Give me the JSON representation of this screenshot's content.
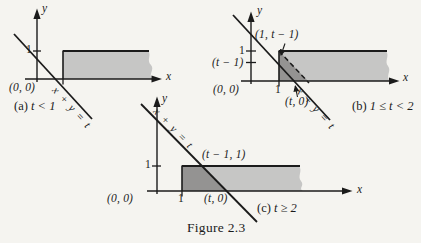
{
  "figure": {
    "caption": "Figure 2.3"
  },
  "colors": {
    "background": "#f5f4f0",
    "strip_light_gray": "#c6c6c5",
    "region_dark_gray": "#949392",
    "ink": "#1b1b1b"
  },
  "panels": {
    "a": {
      "caption_label": "(a)",
      "caption_condition": "t < 1",
      "y_axis_label": "y",
      "x_axis_label": "x",
      "y_tick_1": "1",
      "origin_label": "(0, 0)",
      "line_label": "x + y = t"
    },
    "b": {
      "caption_label": "(b)",
      "caption_condition": "1 ≤ t < 2",
      "y_axis_label": "y",
      "x_axis_label": "x",
      "y_tick_1": "1",
      "y_tick_t_minus_1": "(t − 1)",
      "x_tick_1": "1",
      "origin_label": "(0, 0)",
      "point_label_top": "(1, t − 1)",
      "point_label_bottom": "(t, 0)",
      "line_label": "x + y = t"
    },
    "c": {
      "caption_label": "(c)",
      "caption_condition": "t ≥ 2",
      "y_axis_label": "y",
      "x_axis_label": "x",
      "y_tick_1": "1",
      "x_tick_1": "1",
      "origin_label": "(0, 0)",
      "point_label_top": "(t − 1, 1)",
      "point_label_bottom": "(t, 0)",
      "line_label": "x + y = t"
    }
  }
}
